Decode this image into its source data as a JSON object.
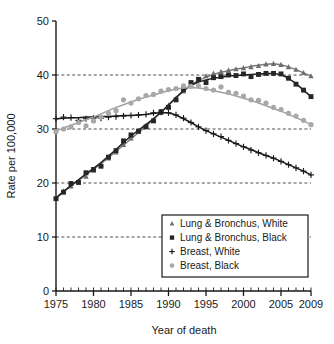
{
  "chart_data": {
    "type": "line",
    "title": "",
    "subtitle": "",
    "xlabel": "Year of death",
    "ylabel": "Rate per 100,000",
    "xlim": [
      1975,
      2009
    ],
    "ylim": [
      0,
      50
    ],
    "ytick_labels": [
      "0",
      "10",
      "20",
      "30",
      "40",
      "50"
    ],
    "yticks": [
      0,
      10,
      20,
      30,
      40,
      50
    ],
    "xtick_labels": [
      "1975",
      "1980",
      "1985",
      "1990",
      "1995",
      "2000",
      "2005",
      "2009"
    ],
    "xticks": [
      1975,
      1980,
      1985,
      1990,
      1995,
      2000,
      2005,
      2009
    ],
    "minor_xtick_step": 1,
    "grid": "horizontal-dashed-at-10-20-30-40",
    "legend_position": "lower-right-inside-boxed",
    "x": [
      1975,
      1976,
      1977,
      1978,
      1979,
      1980,
      1981,
      1982,
      1983,
      1984,
      1985,
      1986,
      1987,
      1988,
      1989,
      1990,
      1991,
      1992,
      1993,
      1994,
      1995,
      1996,
      1997,
      1998,
      1999,
      2000,
      2001,
      2002,
      2003,
      2004,
      2005,
      2006,
      2007,
      2008,
      2009
    ],
    "series": [
      {
        "name": "Lung & Bronchus, White",
        "marker": "triangle",
        "color": "#6e6e6e",
        "line_color": "#7a7a7a",
        "points": [
          17.4,
          18.5,
          19.4,
          20.3,
          21.2,
          22.3,
          23.4,
          24.6,
          25.7,
          27.1,
          28.3,
          29.5,
          30.6,
          31.7,
          33.0,
          34.4,
          35.7,
          37.0,
          38.3,
          39.2,
          39.8,
          40.3,
          40.6,
          40.9,
          41.1,
          41.3,
          41.5,
          41.7,
          42.0,
          42.1,
          41.9,
          41.5,
          41.0,
          40.4,
          39.8
        ],
        "fitted": [
          17.3,
          18.4,
          19.5,
          20.5,
          21.5,
          22.5,
          23.6,
          24.7,
          25.9,
          27.0,
          28.2,
          29.3,
          30.5,
          31.8,
          33.1,
          34.5,
          35.8,
          37.1,
          38.2,
          39.0,
          39.6,
          40.1,
          40.5,
          40.8,
          41.1,
          41.3,
          41.6,
          41.8,
          42.0,
          42.1,
          41.9,
          41.5,
          41.0,
          40.4,
          39.8
        ]
      },
      {
        "name": "Lung & Bronchus, Black",
        "marker": "square",
        "color": "#262626",
        "line_color": "#1f1f1f",
        "points": [
          17.1,
          18.3,
          19.9,
          20.1,
          21.9,
          22.5,
          23.1,
          24.8,
          26.0,
          27.8,
          28.9,
          29.6,
          30.4,
          31.5,
          33.2,
          34.0,
          35.4,
          37.3,
          38.6,
          39.2,
          38.6,
          39.5,
          39.7,
          40.0,
          39.9,
          40.2,
          39.7,
          40.1,
          40.3,
          40.3,
          40.2,
          39.4,
          38.3,
          37.2,
          36.0
        ],
        "fitted": [
          17.2,
          18.4,
          19.5,
          20.6,
          21.7,
          22.7,
          23.8,
          25.0,
          26.2,
          27.5,
          28.7,
          29.8,
          30.8,
          31.9,
          33.1,
          34.4,
          35.8,
          37.1,
          38.1,
          38.7,
          39.1,
          39.4,
          39.6,
          39.8,
          39.9,
          40.0,
          40.1,
          40.2,
          40.3,
          40.3,
          40.1,
          39.4,
          38.4,
          37.2,
          36.0
        ]
      },
      {
        "name": "Breast, White",
        "marker": "plus",
        "color": "#1a1a1a",
        "line_color": "#1a1a1a",
        "points": [
          31.9,
          32.2,
          32.1,
          31.6,
          31.9,
          32.0,
          32.0,
          32.2,
          32.3,
          32.4,
          32.5,
          32.6,
          32.7,
          33.0,
          33.1,
          33.0,
          32.6,
          32.0,
          31.2,
          30.4,
          29.7,
          29.1,
          28.6,
          27.9,
          27.3,
          26.7,
          26.1,
          25.6,
          25.1,
          24.6,
          24.0,
          23.4,
          22.8,
          22.2,
          21.5
        ],
        "fitted": [
          31.9,
          32.0,
          32.1,
          32.1,
          32.2,
          32.2,
          32.3,
          32.3,
          32.4,
          32.5,
          32.5,
          32.6,
          32.7,
          32.9,
          33.0,
          33.0,
          32.6,
          31.9,
          31.2,
          30.4,
          29.7,
          29.1,
          28.5,
          27.9,
          27.3,
          26.7,
          26.2,
          25.6,
          25.1,
          24.6,
          24.0,
          23.4,
          22.8,
          22.2,
          21.5
        ]
      },
      {
        "name": "Breast, Black",
        "marker": "circle",
        "color": "#a8a8a8",
        "line_color": "#a0a0a0",
        "points": [
          29.5,
          30.0,
          30.4,
          31.2,
          30.6,
          31.5,
          32.2,
          32.9,
          33.4,
          35.4,
          34.8,
          35.6,
          36.2,
          36.4,
          37.0,
          37.3,
          37.5,
          38.0,
          37.9,
          38.0,
          37.5,
          37.2,
          37.8,
          36.8,
          36.6,
          36.1,
          35.4,
          35.3,
          34.8,
          34.0,
          33.6,
          32.9,
          32.4,
          31.6,
          30.8
        ],
        "fitted": [
          29.6,
          30.2,
          30.7,
          31.2,
          31.7,
          32.2,
          32.8,
          33.4,
          34.0,
          34.5,
          35.0,
          35.5,
          35.9,
          36.3,
          36.7,
          37.1,
          37.4,
          37.6,
          37.7,
          37.6,
          37.4,
          37.1,
          36.8,
          36.5,
          36.1,
          35.7,
          35.3,
          34.8,
          34.3,
          33.8,
          33.3,
          32.7,
          32.1,
          31.5,
          30.8
        ]
      }
    ],
    "legend": [
      {
        "label": "Lung & Bronchus, White",
        "marker": "triangle",
        "color": "#6e6e6e"
      },
      {
        "label": "Lung & Bronchus, Black",
        "marker": "square",
        "color": "#262626"
      },
      {
        "label": "Breast, White",
        "marker": "plus",
        "color": "#1a1a1a"
      },
      {
        "label": "Breast, Black",
        "marker": "circle",
        "color": "#a8a8a8"
      }
    ]
  }
}
